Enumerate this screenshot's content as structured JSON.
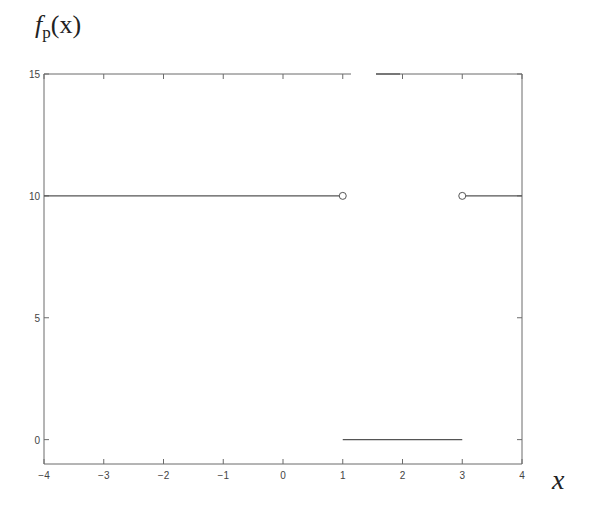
{
  "chart_data": {
    "type": "line",
    "title_parts": {
      "f": "f",
      "sub": "p",
      "arg": "(x)"
    },
    "xlabel": "x",
    "ylabel": "",
    "xlim": [
      -4,
      4
    ],
    "ylim": [
      -1,
      15
    ],
    "xticks": [
      -4,
      -3,
      -2,
      -1,
      0,
      1,
      2,
      3,
      4
    ],
    "xtick_labels": [
      "−4",
      "−3",
      "−2",
      "−1",
      "0",
      "1",
      "2",
      "3",
      "4"
    ],
    "yticks": [
      0,
      5,
      10,
      15
    ],
    "ytick_labels": [
      "0",
      "5",
      "10",
      "15"
    ],
    "grid": false,
    "legend": null,
    "series": [
      {
        "name": "segment-left",
        "x": [
          -4,
          1
        ],
        "y": [
          10,
          10
        ]
      },
      {
        "name": "segment-middle",
        "x": [
          1,
          3
        ],
        "y": [
          0,
          0
        ]
      },
      {
        "name": "segment-right",
        "x": [
          3,
          4
        ],
        "y": [
          10,
          10
        ]
      }
    ],
    "open_points": [
      {
        "x": 1,
        "y": 10
      },
      {
        "x": 3,
        "y": 10
      }
    ]
  }
}
